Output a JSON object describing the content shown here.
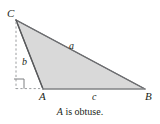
{
  "figure": {
    "title_caption": {
      "variable": "A",
      "rest": " is obtuse."
    },
    "vertices": [
      {
        "name": "C",
        "label": "C",
        "x": 16,
        "y": 20
      },
      {
        "name": "A",
        "label": "A",
        "x": 43,
        "y": 89
      },
      {
        "name": "B",
        "label": "B",
        "x": 145,
        "y": 89
      }
    ],
    "sides": [
      {
        "name": "a",
        "label": "a",
        "from": "C",
        "to": "B"
      },
      {
        "name": "b",
        "label": "b",
        "from": "C",
        "to": "A"
      },
      {
        "name": "c",
        "label": "c",
        "from": "A",
        "to": "B"
      }
    ],
    "markers": {
      "right_angle": "right-angle-square",
      "altitude_line": "dashed-vertical-from-C",
      "base_extension": "dashed-horizontal-to-A"
    },
    "colors": {
      "fill": "#d9d9d9",
      "stroke": "#58595b",
      "dashed": "#8a8c8e",
      "text": "#231f20",
      "background": "#ffffff"
    }
  }
}
